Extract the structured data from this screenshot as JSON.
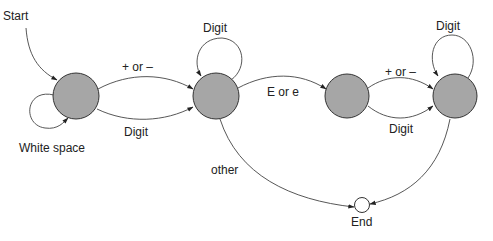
{
  "diagram": {
    "type": "finite-state-machine",
    "colors": {
      "state_fill": "#a6a6a6",
      "final_fill": "#ffffff",
      "stroke": "#333333"
    },
    "start_label": "Start",
    "end_label": "End",
    "states": [
      {
        "id": "s1",
        "label": ""
      },
      {
        "id": "s2",
        "label": ""
      },
      {
        "id": "s3",
        "label": ""
      },
      {
        "id": "s4",
        "label": ""
      },
      {
        "id": "end",
        "label": "End"
      }
    ],
    "edges": [
      {
        "from": "start",
        "to": "s1",
        "label": "Start"
      },
      {
        "from": "s1",
        "to": "s1",
        "label": "White space"
      },
      {
        "from": "s1",
        "to": "s2",
        "label": "+ or –"
      },
      {
        "from": "s1",
        "to": "s2",
        "label": "Digit"
      },
      {
        "from": "s2",
        "to": "s2",
        "label": "Digit"
      },
      {
        "from": "s2",
        "to": "s3",
        "label": "E or e"
      },
      {
        "from": "s2",
        "to": "end",
        "label": "other"
      },
      {
        "from": "s3",
        "to": "s4",
        "label": "+ or –"
      },
      {
        "from": "s3",
        "to": "s4",
        "label": "Digit"
      },
      {
        "from": "s4",
        "to": "s4",
        "label": "Digit"
      },
      {
        "from": "s4",
        "to": "end",
        "label": ""
      }
    ]
  }
}
